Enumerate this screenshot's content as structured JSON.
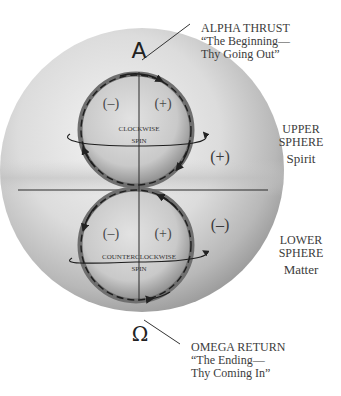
{
  "diagram": {
    "alpha_symbol": "A",
    "omega_symbol": "Ω",
    "alpha_callout": {
      "line1": "ALPHA THRUST",
      "line2": "“The Beginning—",
      "line3": "Thy Going Out”"
    },
    "omega_callout": {
      "line1": "OMEGA RETURN",
      "line2": "“The Ending—",
      "line3": "Thy Coming In”"
    },
    "upper_sphere_label": {
      "line1": "UPPER",
      "line2": "SPHERE",
      "sub": "Spirit"
    },
    "lower_sphere_label": {
      "line1": "LOWER",
      "line2": "SPHERE",
      "sub": "Matter"
    },
    "upper_inner": {
      "left_sign": "(–)",
      "right_sign": "(+)",
      "spin_line1": "CLOCKWISE",
      "spin_line2": "SPIN"
    },
    "lower_inner": {
      "left_sign": "(–)",
      "right_sign": "(+)",
      "spin_line1": "COUNTERCLOCKWISE",
      "spin_line2": "SPIN"
    },
    "outer_upper_sign": "(+)",
    "outer_lower_sign": "(–)"
  }
}
